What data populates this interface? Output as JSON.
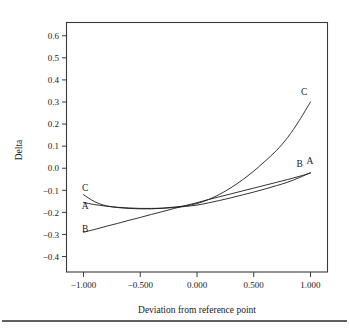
{
  "chart_data": {
    "type": "line",
    "title": "",
    "xlabel": "Deviation from reference point",
    "ylabel": "Delta",
    "xlim": [
      -1.15,
      1.15
    ],
    "ylim": [
      -0.47,
      0.66
    ],
    "grid": false,
    "legend": "inline-endpoint-labels",
    "xticks": [
      -1.0,
      -0.5,
      0.0,
      0.5,
      1.0
    ],
    "xticklabels": [
      "−1.000",
      "−0.500",
      "0.000",
      "0.500",
      "1.000"
    ],
    "yticks": [
      0.6,
      0.5,
      0.4,
      0.3,
      0.2,
      0.1,
      0.0,
      -0.1,
      -0.2,
      -0.3,
      -0.4
    ],
    "yticklabels": [
      "0.6",
      "0.5",
      "0.4",
      "0.3",
      "0.2",
      "0.1",
      "0.0",
      "−0.1",
      "−0.2",
      "−0.3",
      "−0.4"
    ],
    "x": [
      -1.0,
      -0.9,
      -0.8,
      -0.7,
      -0.6,
      -0.5,
      -0.4,
      -0.3,
      -0.2,
      -0.1,
      0.0,
      0.1,
      0.2,
      0.3,
      0.4,
      0.5,
      0.6,
      0.7,
      0.8,
      0.9,
      1.0
    ],
    "series": [
      {
        "name": "A",
        "label": "A",
        "color": "#1d1d1d",
        "values": [
          -0.155,
          -0.165,
          -0.172,
          -0.177,
          -0.18,
          -0.182,
          -0.182,
          -0.181,
          -0.178,
          -0.173,
          -0.167,
          -0.157,
          -0.146,
          -0.134,
          -0.121,
          -0.108,
          -0.094,
          -0.079,
          -0.063,
          -0.043,
          -0.02
        ]
      },
      {
        "name": "B",
        "label": "B",
        "color": "#1d1d1d",
        "values": [
          -0.29,
          -0.277,
          -0.263,
          -0.25,
          -0.236,
          -0.223,
          -0.209,
          -0.196,
          -0.182,
          -0.169,
          -0.156,
          -0.142,
          -0.129,
          -0.116,
          -0.103,
          -0.09,
          -0.077,
          -0.064,
          -0.051,
          -0.037,
          -0.022
        ]
      },
      {
        "name": "C",
        "label": "C",
        "color": "#1d1d1d",
        "values": [
          -0.12,
          -0.152,
          -0.17,
          -0.178,
          -0.182,
          -0.184,
          -0.184,
          -0.181,
          -0.176,
          -0.17,
          -0.16,
          -0.142,
          -0.118,
          -0.088,
          -0.053,
          -0.013,
          0.032,
          0.08,
          0.14,
          0.215,
          0.3
        ]
      }
    ],
    "endpoint_labels": {
      "left": [
        {
          "series": "C",
          "text": "C",
          "x": -0.985,
          "y": -0.105
        },
        {
          "series": "A",
          "text": "A",
          "x": -0.985,
          "y": -0.185
        },
        {
          "series": "B",
          "text": "B",
          "x": -0.985,
          "y": -0.29
        }
      ],
      "right": [
        {
          "series": "C",
          "text": "C",
          "x": 0.945,
          "y": 0.33
        },
        {
          "series": "B",
          "text": "B",
          "x": 0.905,
          "y": 0.005
        },
        {
          "series": "A",
          "text": "A",
          "x": 0.995,
          "y": 0.018
        }
      ]
    }
  }
}
